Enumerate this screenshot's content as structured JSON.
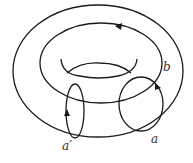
{
  "diagram": {
    "type": "torus-with-loops",
    "labels": {
      "a": "a",
      "a_prime": "a′",
      "b": "b"
    },
    "colors": {
      "stroke": "#1a1a1a",
      "label": "#333333",
      "background": "#ffffff"
    }
  }
}
